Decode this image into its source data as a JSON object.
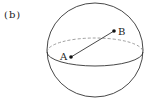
{
  "figure": {
    "panel_label": "(b)",
    "sphere": {
      "cx": 95,
      "cy": 50,
      "rx": 48,
      "ry": 47
    },
    "equator": {
      "cx": 95,
      "cy": 52,
      "rx": 48,
      "ry": 14
    },
    "points": [
      {
        "label": "A",
        "x": 71,
        "y": 57
      },
      {
        "label": "B",
        "x": 114,
        "y": 31
      }
    ],
    "colors": {
      "stroke": "#333333",
      "dashed": "#888888"
    }
  }
}
